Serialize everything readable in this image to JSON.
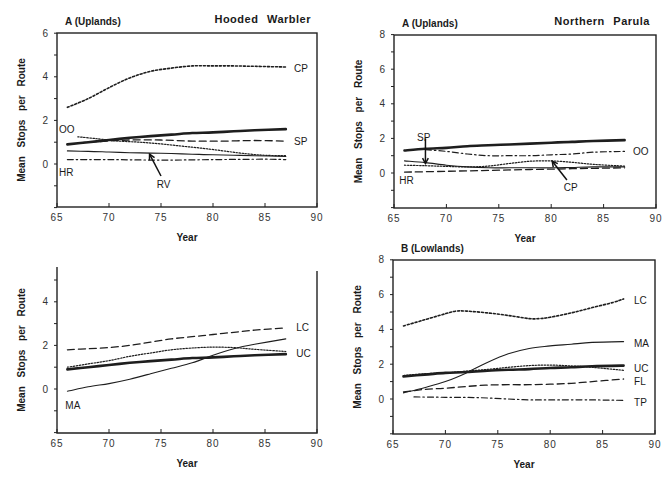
{
  "chart_data": [
    {
      "id": "p1",
      "type": "line",
      "panel_label": "A (Uplands)",
      "title": "Hooded Warbler",
      "xlabel": "Year",
      "ylabel": "Mean Stops per Route",
      "xlim": [
        65,
        90
      ],
      "ylim": [
        -2,
        6
      ],
      "xticks": [
        65,
        70,
        75,
        80,
        85,
        90
      ],
      "yticks": [
        0,
        2,
        4,
        6
      ],
      "grid": false,
      "box": "full",
      "px": {
        "x0": 57,
        "x1": 317,
        "yzero": 164,
        "yscale": 21.8,
        "ytop": 33,
        "ybottom": 207
      },
      "series": [
        {
          "name": "CP",
          "style": "dotted-heavy",
          "x": [
            66,
            68,
            70,
            72,
            74,
            76,
            78,
            80,
            82,
            84,
            87
          ],
          "values": [
            2.6,
            3.0,
            3.5,
            3.95,
            4.25,
            4.4,
            4.5,
            4.5,
            4.5,
            4.48,
            4.45
          ]
        },
        {
          "name": "SP",
          "style": "dashed",
          "x": [
            66,
            68,
            70,
            72,
            75,
            78,
            81,
            84,
            87
          ],
          "values": [
            0.9,
            1.0,
            1.05,
            1.1,
            1.1,
            1.05,
            1.05,
            1.08,
            1.05
          ]
        },
        {
          "name": "(bold)",
          "style": "bold",
          "x": [
            66,
            68,
            70,
            72,
            74,
            76,
            78,
            80,
            82,
            84,
            87
          ],
          "values": [
            0.9,
            1.0,
            1.1,
            1.2,
            1.28,
            1.35,
            1.42,
            1.45,
            1.5,
            1.55,
            1.6
          ]
        },
        {
          "name": "OO",
          "style": "dotted",
          "x": [
            67,
            69,
            71,
            73,
            75,
            77,
            79,
            81,
            83,
            85,
            87
          ],
          "values": [
            1.25,
            1.15,
            1.05,
            1.0,
            0.92,
            0.82,
            0.72,
            0.6,
            0.48,
            0.4,
            0.38
          ]
        },
        {
          "name": "RV",
          "style": "thin",
          "x": [
            66,
            68,
            70,
            72,
            74,
            76,
            78,
            80,
            82,
            84,
            87
          ],
          "values": [
            0.6,
            0.58,
            0.55,
            0.52,
            0.5,
            0.48,
            0.45,
            0.42,
            0.4,
            0.38,
            0.35
          ]
        },
        {
          "name": "HR",
          "style": "dashdot",
          "x": [
            66,
            70,
            75,
            80,
            85,
            87
          ],
          "values": [
            0.2,
            0.2,
            0.18,
            0.2,
            0.22,
            0.2
          ]
        }
      ],
      "labels": [
        {
          "text": "CP",
          "x": 87.8,
          "y": 4.4
        },
        {
          "text": "SP",
          "x": 87.8,
          "y": 1.05
        },
        {
          "text": "OO",
          "x": 65.2,
          "y": 1.6
        },
        {
          "text": "HR",
          "x": 65.2,
          "y": -0.35
        },
        {
          "text": "RV",
          "x": 74.6,
          "y": -0.9
        }
      ],
      "arrows": [
        {
          "from": [
            75.0,
            -0.55
          ],
          "to": [
            73.9,
            0.45
          ]
        }
      ]
    },
    {
      "id": "p2",
      "type": "line",
      "panel_label": "A (Uplands)",
      "title": "Northern Parula",
      "xlabel": "Year",
      "ylabel": "Mean Stops per Route",
      "xlim": [
        65,
        90
      ],
      "ylim": [
        -2,
        8
      ],
      "xticks": [
        65,
        70,
        75,
        80,
        85,
        90
      ],
      "yticks": [
        0,
        2,
        4,
        6,
        8
      ],
      "grid": false,
      "box": "full",
      "px": {
        "x0": 394,
        "x1": 656,
        "yzero": 173,
        "yscale": 17.3,
        "ytop": 35,
        "ybottom": 208
      },
      "series": [
        {
          "name": "(bold)",
          "style": "bold",
          "x": [
            66,
            68,
            70,
            72,
            74,
            76,
            78,
            80,
            82,
            84,
            87
          ],
          "values": [
            1.3,
            1.4,
            1.45,
            1.55,
            1.6,
            1.65,
            1.7,
            1.75,
            1.8,
            1.85,
            1.9
          ]
        },
        {
          "name": "OO",
          "style": "dashdot",
          "x": [
            68,
            70,
            72,
            74,
            76,
            78,
            80,
            82,
            84,
            87
          ],
          "values": [
            1.35,
            1.25,
            1.1,
            1.0,
            1.0,
            1.0,
            1.05,
            1.1,
            1.2,
            1.25
          ]
        },
        {
          "name": "SP",
          "style": "thin",
          "x": [
            66,
            68,
            70,
            72,
            74,
            76,
            78,
            80,
            82,
            84,
            87
          ],
          "values": [
            0.7,
            0.6,
            0.45,
            0.35,
            0.3,
            0.3,
            0.3,
            0.3,
            0.32,
            0.35,
            0.35
          ]
        },
        {
          "name": "CP",
          "style": "dotted",
          "x": [
            66,
            68,
            70,
            72,
            74,
            76,
            78,
            80,
            82,
            84,
            87
          ],
          "values": [
            0.45,
            0.42,
            0.38,
            0.35,
            0.4,
            0.55,
            0.68,
            0.7,
            0.62,
            0.5,
            0.4
          ]
        },
        {
          "name": "HR",
          "style": "dashed",
          "x": [
            66,
            70,
            74,
            78,
            82,
            87
          ],
          "values": [
            0.05,
            0.1,
            0.15,
            0.2,
            0.25,
            0.3
          ]
        }
      ],
      "labels": [
        {
          "text": "SP",
          "x": 67.2,
          "y": 2.1
        },
        {
          "text": "OO",
          "x": 87.8,
          "y": 1.25
        },
        {
          "text": "HR",
          "x": 65.5,
          "y": -0.4
        },
        {
          "text": "CP",
          "x": 81.2,
          "y": -0.8
        }
      ],
      "arrows": [
        {
          "from": [
            68.0,
            2.0
          ],
          "to": [
            68.0,
            0.55
          ]
        },
        {
          "from": [
            81.5,
            -0.4
          ],
          "to": [
            80.1,
            0.68
          ]
        }
      ]
    },
    {
      "id": "p3",
      "type": "line",
      "panel_label": "",
      "title": "",
      "xlabel": "Year",
      "ylabel": "Mean Stops per Route",
      "xlim": [
        65,
        90
      ],
      "ylim": [
        -2,
        5.5
      ],
      "xticks": [
        65,
        70,
        75,
        80,
        85,
        90
      ],
      "yticks": [
        0,
        2,
        4
      ],
      "grid": false,
      "box": "open-top",
      "px": {
        "x0": 57,
        "x1": 317,
        "yzero": 389,
        "yscale": 21.8,
        "ytop": 267,
        "ybottom": 433
      },
      "series": [
        {
          "name": "LC",
          "style": "dashed",
          "x": [
            66,
            68,
            70,
            72,
            74,
            76,
            78,
            80,
            82,
            84,
            87
          ],
          "values": [
            1.8,
            1.85,
            1.9,
            2.0,
            2.15,
            2.3,
            2.4,
            2.5,
            2.6,
            2.7,
            2.8
          ]
        },
        {
          "name": "UC",
          "style": "dotted",
          "x": [
            66,
            68,
            70,
            72,
            74,
            76,
            78,
            80,
            82,
            84,
            87
          ],
          "values": [
            1.0,
            1.15,
            1.3,
            1.5,
            1.65,
            1.8,
            1.88,
            1.92,
            1.9,
            1.82,
            1.72
          ]
        },
        {
          "name": "(bold)",
          "style": "bold",
          "x": [
            66,
            68,
            70,
            72,
            74,
            76,
            78,
            80,
            82,
            84,
            87
          ],
          "values": [
            0.9,
            1.0,
            1.1,
            1.2,
            1.28,
            1.35,
            1.42,
            1.45,
            1.5,
            1.55,
            1.6
          ]
        },
        {
          "name": "MA",
          "style": "thin",
          "x": [
            66,
            68,
            70,
            72,
            74,
            76,
            78,
            80,
            82,
            84,
            87
          ],
          "values": [
            -0.1,
            0.1,
            0.25,
            0.45,
            0.7,
            0.95,
            1.2,
            1.55,
            1.85,
            2.05,
            2.3
          ]
        }
      ],
      "labels": [
        {
          "text": "LC",
          "x": 88.0,
          "y": 2.85
        },
        {
          "text": "UC",
          "x": 88.0,
          "y": 1.65
        },
        {
          "text": "MA",
          "x": 65.8,
          "y": -0.75
        }
      ],
      "arrows": []
    },
    {
      "id": "p4",
      "type": "line",
      "panel_label": "B (Lowlands)",
      "title": "",
      "xlabel": "Year",
      "ylabel": "Mean Stops per Route",
      "xlim": [
        65,
        90
      ],
      "ylim": [
        -2,
        8
      ],
      "xticks": [
        65,
        70,
        75,
        80,
        85,
        90
      ],
      "yticks": [
        0,
        2,
        4,
        6,
        8
      ],
      "grid": false,
      "box": "full",
      "px": {
        "x0": 393,
        "x1": 655,
        "yzero": 399,
        "yscale": 17.4,
        "ytop": 260,
        "ybottom": 434
      },
      "series": [
        {
          "name": "LC",
          "style": "dotted-heavy",
          "x": [
            66,
            68,
            70,
            71,
            72,
            74,
            76,
            78,
            79,
            80,
            82,
            84,
            86,
            87
          ],
          "values": [
            4.2,
            4.55,
            4.9,
            5.05,
            5.05,
            4.95,
            4.8,
            4.62,
            4.62,
            4.7,
            4.95,
            5.25,
            5.55,
            5.75
          ]
        },
        {
          "name": "MA",
          "style": "thin",
          "x": [
            66,
            68,
            70,
            72,
            74,
            76,
            78,
            80,
            82,
            84,
            87
          ],
          "values": [
            0.35,
            0.65,
            1.0,
            1.5,
            2.1,
            2.6,
            2.9,
            3.05,
            3.15,
            3.25,
            3.3
          ]
        },
        {
          "name": "UC",
          "style": "dotted",
          "x": [
            66,
            68,
            70,
            72,
            74,
            76,
            78,
            80,
            82,
            84,
            87
          ],
          "values": [
            1.35,
            1.45,
            1.5,
            1.6,
            1.7,
            1.82,
            1.92,
            1.95,
            1.9,
            1.82,
            1.65
          ]
        },
        {
          "name": "(bold)",
          "style": "bold",
          "x": [
            66,
            68,
            70,
            72,
            74,
            76,
            78,
            80,
            82,
            84,
            87
          ],
          "values": [
            1.3,
            1.4,
            1.5,
            1.55,
            1.62,
            1.68,
            1.72,
            1.78,
            1.82,
            1.88,
            1.92
          ]
        },
        {
          "name": "FL",
          "style": "dashed",
          "x": [
            66,
            68,
            70,
            72,
            74,
            76,
            78,
            80,
            82,
            84,
            87
          ],
          "values": [
            0.4,
            0.55,
            0.62,
            0.72,
            0.8,
            0.82,
            0.82,
            0.85,
            0.9,
            1.0,
            1.15
          ]
        },
        {
          "name": "TP",
          "style": "dashdot",
          "x": [
            67,
            70,
            73,
            76,
            78,
            80,
            84,
            87
          ],
          "values": [
            0.12,
            0.1,
            0.08,
            0.0,
            -0.05,
            -0.05,
            -0.05,
            -0.08
          ]
        }
      ],
      "labels": [
        {
          "text": "LC",
          "x": 88.0,
          "y": 5.7
        },
        {
          "text": "MA",
          "x": 88.0,
          "y": 3.2
        },
        {
          "text": "UC",
          "x": 88.0,
          "y": 1.8
        },
        {
          "text": "FL",
          "x": 88.0,
          "y": 1.05
        },
        {
          "text": "TP",
          "x": 88.0,
          "y": -0.2
        }
      ],
      "arrows": []
    }
  ]
}
